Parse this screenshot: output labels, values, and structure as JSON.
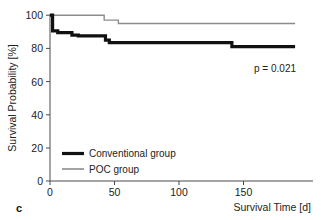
{
  "panel": {
    "label": "c"
  },
  "chart_data": {
    "type": "line",
    "subtype": "kaplan-meier-step",
    "title": "",
    "xlabel": "Survival Time [d]",
    "ylabel": "Survival Probability [%]",
    "xlim": [
      0,
      190
    ],
    "ylim": [
      0,
      100
    ],
    "xticks": [
      0,
      50,
      100,
      150
    ],
    "xtick_labels": [
      "0",
      "50",
      "100",
      "150"
    ],
    "yticks": [
      0,
      20,
      40,
      60,
      80,
      100
    ],
    "ytick_labels": [
      "0",
      "20",
      "40",
      "60",
      "80",
      "100"
    ],
    "grid": false,
    "legend_position": "lower-left-inside",
    "annotations": [
      {
        "name": "p-value",
        "text": "p = 0.021",
        "x": 150,
        "y": 68
      }
    ],
    "series": [
      {
        "name": "Conventional group",
        "color": "#111111",
        "line_width": 3.2,
        "x": [
          0,
          2,
          2,
          6,
          6,
          17,
          17,
          22,
          22,
          43,
          43,
          46,
          46,
          141,
          141,
          190
        ],
        "y": [
          100,
          100,
          90.5,
          90.5,
          89.5,
          89.5,
          88,
          88,
          87.5,
          87.5,
          85,
          85,
          83.5,
          83.5,
          81,
          81
        ],
        "steps": [
          {
            "day": 0,
            "survival": 100
          },
          {
            "day": 2,
            "survival": 90.5
          },
          {
            "day": 6,
            "survival": 89.5
          },
          {
            "day": 17,
            "survival": 88
          },
          {
            "day": 22,
            "survival": 87.5
          },
          {
            "day": 43,
            "survival": 85
          },
          {
            "day": 46,
            "survival": 83.5
          },
          {
            "day": 141,
            "survival": 81
          },
          {
            "day": 190,
            "survival": 81
          }
        ]
      },
      {
        "name": "POC group",
        "color": "#8c8c8c",
        "line_width": 1.4,
        "x": [
          0,
          42,
          42,
          53,
          53,
          190
        ],
        "y": [
          100,
          100,
          97,
          97,
          95,
          95
        ],
        "steps": [
          {
            "day": 0,
            "survival": 100
          },
          {
            "day": 42,
            "survival": 97
          },
          {
            "day": 53,
            "survival": 95
          },
          {
            "day": 190,
            "survival": 95
          }
        ]
      }
    ]
  },
  "legend": {
    "items": [
      {
        "label": "Conventional group",
        "color": "#111111",
        "line_width": 3.2
      },
      {
        "label": "POC group",
        "color": "#8c8c8c",
        "line_width": 1.4
      }
    ]
  },
  "axes": {
    "x_title": "Survival Time [d]",
    "y_title": "Survival Probability [%]",
    "x_tick_labels": [
      "0",
      "50",
      "100",
      "150"
    ],
    "y_tick_labels": [
      "0",
      "20",
      "40",
      "60",
      "80",
      "100"
    ]
  },
  "stats": {
    "p_value_text": "p = 0.021"
  },
  "colors": {
    "background": "#ffffff",
    "axis": "#4a4a4a",
    "conventional": "#111111",
    "poc": "#8c8c8c",
    "text": "#222222"
  }
}
